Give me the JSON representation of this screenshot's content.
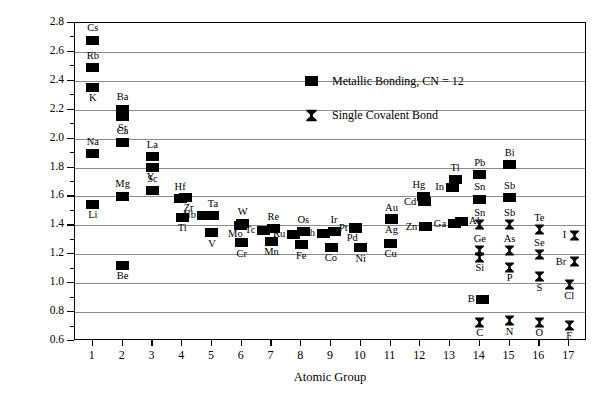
{
  "chart_data": {
    "type": "scatter",
    "title": "",
    "xlabel": "Atomic Group",
    "ylabel": "Atomic Radius (Å)",
    "xlim": [
      0.4,
      17.6
    ],
    "ylim": [
      0.6,
      2.8
    ],
    "ytick_labels": [
      "0.6",
      "0.8",
      "1.0",
      "1.2",
      "1.4",
      "1.6",
      "1.8",
      "2.0",
      "2.2",
      "2.4",
      "2.6",
      "2.8"
    ],
    "ytick_values": [
      0.6,
      0.8,
      1.0,
      1.2,
      1.4,
      1.6,
      1.8,
      2.0,
      2.2,
      2.4,
      2.6,
      2.8
    ],
    "yminor_step": 0.1,
    "xtick_labels": [
      "1",
      "2",
      "3",
      "4",
      "5",
      "6",
      "7",
      "8",
      "9",
      "10",
      "11",
      "12",
      "13",
      "14",
      "15",
      "16",
      "17"
    ],
    "xtick_values": [
      1,
      2,
      3,
      4,
      5,
      6,
      7,
      8,
      9,
      10,
      11,
      12,
      13,
      14,
      15,
      16,
      17
    ],
    "grid": "horizontal",
    "legend_position": "top-center",
    "series": [
      {
        "name": "Metallic Bonding, CN = 12",
        "marker": "filled-square",
        "points": [
          {
            "label": "Cs",
            "x": 1,
            "y": 2.68,
            "lp": "above"
          },
          {
            "label": "Rb",
            "x": 1,
            "y": 2.49,
            "lp": "above"
          },
          {
            "label": "K",
            "x": 1,
            "y": 2.355,
            "lp": "below"
          },
          {
            "label": "Na",
            "x": 1,
            "y": 1.895,
            "lp": "above"
          },
          {
            "label": "Li",
            "x": 1,
            "y": 1.545,
            "lp": "below"
          },
          {
            "label": "Ba",
            "x": 2,
            "y": 2.205,
            "lp": "above"
          },
          {
            "label": "Sr",
            "x": 2,
            "y": 2.15,
            "lp": "below"
          },
          {
            "label": "Ca",
            "x": 2,
            "y": 1.97,
            "lp": "above"
          },
          {
            "label": "Mg",
            "x": 2,
            "y": 1.6,
            "lp": "above"
          },
          {
            "label": "Be",
            "x": 2,
            "y": 1.125,
            "lp": "below"
          },
          {
            "label": "La",
            "x": 3,
            "y": 1.875,
            "lp": "above"
          },
          {
            "label": "Y",
            "x": 3,
            "y": 1.8,
            "lp": "below-left"
          },
          {
            "label": "Sc",
            "x": 3,
            "y": 1.64,
            "lp": "above"
          },
          {
            "label": "Hf",
            "x": 4,
            "y": 1.585,
            "lp": "above"
          },
          {
            "label": "Zr",
            "x": 4,
            "y": 1.59,
            "lp": "below-right"
          },
          {
            "label": "Ti",
            "x": 4,
            "y": 1.455,
            "lp": "below"
          },
          {
            "label": "Ta",
            "x": 5,
            "y": 1.465,
            "lp": "above"
          },
          {
            "label": "Nb",
            "x": 5,
            "y": 1.47,
            "lp": "left"
          },
          {
            "label": "V",
            "x": 5,
            "y": 1.35,
            "lp": "below"
          },
          {
            "label": "W",
            "x": 6,
            "y": 1.41,
            "lp": "above"
          },
          {
            "label": "Mo",
            "x": 6,
            "y": 1.4,
            "lp": "below-left"
          },
          {
            "label": "Cr",
            "x": 6,
            "y": 1.28,
            "lp": "below"
          },
          {
            "label": "Re",
            "x": 7,
            "y": 1.375,
            "lp": "above"
          },
          {
            "label": "Tc",
            "x": 7,
            "y": 1.365,
            "lp": "left"
          },
          {
            "label": "Mn",
            "x": 7,
            "y": 1.29,
            "lp": "below"
          },
          {
            "label": "Os",
            "x": 8,
            "y": 1.355,
            "lp": "above"
          },
          {
            "label": "Ru",
            "x": 8,
            "y": 1.34,
            "lp": "left"
          },
          {
            "label": "Fe",
            "x": 8,
            "y": 1.265,
            "lp": "below"
          },
          {
            "label": "Ir",
            "x": 9,
            "y": 1.355,
            "lp": "above"
          },
          {
            "label": "Rh",
            "x": 9,
            "y": 1.345,
            "lp": "left"
          },
          {
            "label": "Co",
            "x": 9,
            "y": 1.25,
            "lp": "below"
          },
          {
            "label": "Pt",
            "x": 10,
            "y": 1.385,
            "lp": "left"
          },
          {
            "label": "Pd",
            "x": 10,
            "y": 1.375,
            "lp": "below-left"
          },
          {
            "label": "Ni",
            "x": 10,
            "y": 1.245,
            "lp": "below"
          },
          {
            "label": "Au",
            "x": 11,
            "y": 1.44,
            "lp": "above"
          },
          {
            "label": "Ag",
            "x": 11,
            "y": 1.445,
            "lp": "below"
          },
          {
            "label": "Cu",
            "x": 11,
            "y": 1.275,
            "lp": "below"
          },
          {
            "label": "Cd",
            "x": 12,
            "y": 1.565,
            "lp": "left"
          },
          {
            "label": "Hg",
            "x": 12,
            "y": 1.6,
            "lp": "above-left"
          },
          {
            "label": "Zn",
            "x": 12,
            "y": 1.39,
            "lp": "left"
          },
          {
            "label": "Tl",
            "x": 13,
            "y": 1.715,
            "lp": "above"
          },
          {
            "label": "In",
            "x": 13,
            "y": 1.665,
            "lp": "left"
          },
          {
            "label": "Ga",
            "x": 13,
            "y": 1.41,
            "lp": "left"
          },
          {
            "label": "Al",
            "x": 13,
            "y": 1.43,
            "lp": "right"
          },
          {
            "label": "Pb",
            "x": 14,
            "y": 1.75,
            "lp": "above"
          },
          {
            "label": "Sn",
            "x": 14,
            "y": 1.58,
            "lp": "above"
          },
          {
            "label": "Bi",
            "x": 15,
            "y": 1.82,
            "lp": "above"
          },
          {
            "label": "Sb",
            "x": 15,
            "y": 1.59,
            "lp": "above"
          },
          {
            "label": "B",
            "x": 14,
            "y": 0.89,
            "lp": "left"
          }
        ]
      },
      {
        "name": "Single Covalent Bond",
        "marker": "bowtie",
        "points": [
          {
            "label": "Sn",
            "x": 14,
            "y": 1.405,
            "lp": "above"
          },
          {
            "label": "Ge",
            "x": 14,
            "y": 1.225,
            "lp": "above"
          },
          {
            "label": "Si",
            "x": 14,
            "y": 1.18,
            "lp": "below"
          },
          {
            "label": "C",
            "x": 14,
            "y": 0.73,
            "lp": "below"
          },
          {
            "label": "Sb",
            "x": 15,
            "y": 1.405,
            "lp": "above"
          },
          {
            "label": "As",
            "x": 15,
            "y": 1.225,
            "lp": "above"
          },
          {
            "label": "P",
            "x": 15,
            "y": 1.11,
            "lp": "below"
          },
          {
            "label": "N",
            "x": 15,
            "y": 0.74,
            "lp": "below"
          },
          {
            "label": "Te",
            "x": 16,
            "y": 1.37,
            "lp": "above"
          },
          {
            "label": "Se",
            "x": 16,
            "y": 1.195,
            "lp": "above"
          },
          {
            "label": "S",
            "x": 16,
            "y": 1.045,
            "lp": "below"
          },
          {
            "label": "O",
            "x": 16,
            "y": 0.73,
            "lp": "below"
          },
          {
            "label": "I",
            "x": 17,
            "y": 1.33,
            "lp": "left"
          },
          {
            "label": "Br",
            "x": 17,
            "y": 1.15,
            "lp": "left"
          },
          {
            "label": "Cl",
            "x": 17,
            "y": 0.99,
            "lp": "below"
          },
          {
            "label": "F",
            "x": 17,
            "y": 0.71,
            "lp": "below"
          }
        ]
      }
    ]
  },
  "legend": {
    "items": [
      {
        "label": "Metallic Bonding, CN = 12",
        "marker": "filled-square"
      },
      {
        "label": "Single Covalent Bond",
        "marker": "bowtie"
      }
    ]
  },
  "colors": {
    "marker": "#000000",
    "gridline": "#8c8c8c",
    "axis": "#000000",
    "background": "#ffffff"
  }
}
